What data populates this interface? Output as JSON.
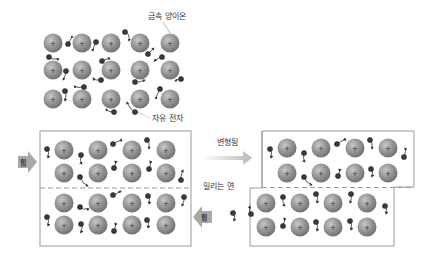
{
  "diagram": {
    "labels": {
      "metal_ion": "금속 양이온",
      "free_electron": "자유 전자",
      "deformed": "변형됨",
      "slip_plane": "밀리는 면",
      "force_left": "힘",
      "force_right": "힘"
    },
    "ion_symbol": "+",
    "colors": {
      "ion_fill": "#8c8c8c",
      "ion_highlight": "#c4c4c4",
      "ion_edge": "#6a6a6a",
      "electron": "#333333",
      "box_border": "#9a9a9a",
      "dashed_line": "#999999",
      "force_arrow": "#a8a8a8",
      "deform_arrow": "#bcbcbc"
    },
    "panels": {
      "lattice": {
        "name": "metal-lattice",
        "rows": 3,
        "cols": 5
      },
      "before": {
        "name": "before-deformation",
        "rows": 4,
        "cols": 4
      },
      "after": {
        "name": "after-deformation",
        "upper_rows": 2,
        "lower_rows": 2,
        "cols": 4
      }
    }
  }
}
